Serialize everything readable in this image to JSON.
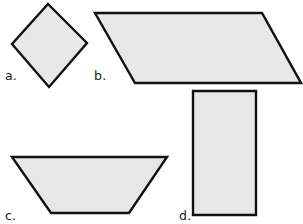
{
  "figure": {
    "background_color": "#ffffff",
    "width": 303,
    "height": 224
  },
  "style": {
    "fill_color": "#e7e7e7",
    "stroke_color": "#111111",
    "stroke_width": 2.4,
    "label_color": "#1a1a1a"
  },
  "shapes": [
    {
      "key": "a",
      "label": "a.",
      "name": "rhombus",
      "points": "48,4 87,43 49,87 12,44",
      "label_x": 5,
      "label_y": 80
    },
    {
      "key": "b",
      "label": "b.",
      "name": "parallelogram",
      "points": "95,13 262,13 301,83 135,83",
      "label_x": 94,
      "label_y": 80
    },
    {
      "key": "c",
      "label": "c.",
      "name": "trapezoid",
      "points": "12,157 167,157 129,213 51,213",
      "label_x": 5,
      "label_y": 220
    },
    {
      "key": "d",
      "label": "d.",
      "name": "rectangle",
      "points": "193,91 256,91 256,215 193,215",
      "label_x": 179,
      "label_y": 220
    }
  ]
}
